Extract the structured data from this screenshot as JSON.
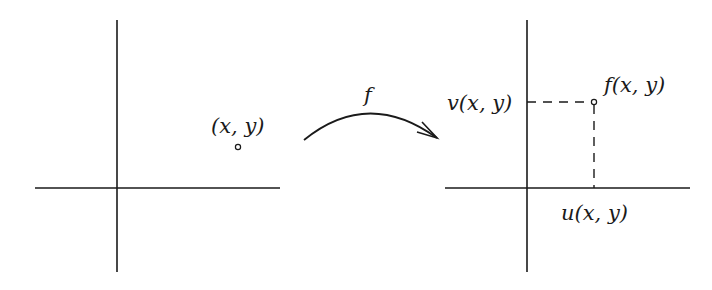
{
  "diagram": {
    "title": "",
    "left_plane": {
      "point_label": "(x, y)"
    },
    "mapping": {
      "label": "f"
    },
    "right_plane": {
      "point_label": "f(x, y)",
      "y_projection_label": "v(x, y)",
      "x_projection_label": "u(x, y)"
    },
    "colors": {
      "stroke": "#1a1a1a",
      "background": "#ffffff"
    }
  }
}
